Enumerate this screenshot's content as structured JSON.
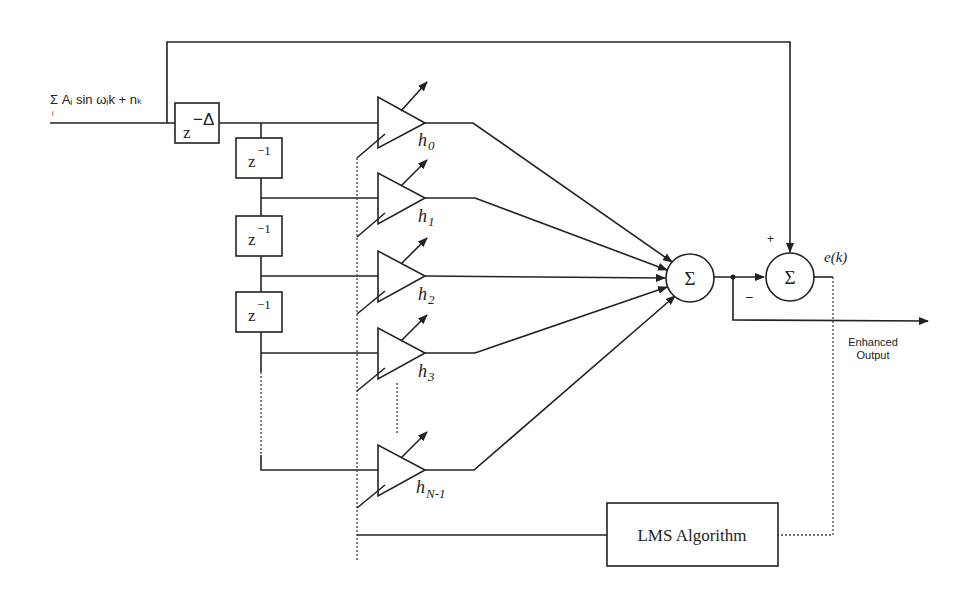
{
  "diagram": {
    "input_label": "Σ Aᵢ sin ωᵢk + nₖ",
    "input_sum_index": "i",
    "delay_block": {
      "base": "z",
      "exp": "−Δ"
    },
    "unit_delays": [
      {
        "base": "z",
        "exp": "−1"
      },
      {
        "base": "z",
        "exp": "−1"
      },
      {
        "base": "z",
        "exp": "−1"
      }
    ],
    "taps": [
      {
        "label": "h",
        "sub": "0"
      },
      {
        "label": "h",
        "sub": "1"
      },
      {
        "label": "h",
        "sub": "2"
      },
      {
        "label": "h",
        "sub": "3"
      },
      {
        "label": "h",
        "sub": "N-1"
      }
    ],
    "summer_symbol": "Σ",
    "error_summer_symbol": "Σ",
    "plus_sign": "+",
    "minus_sign": "−",
    "error_label": "e(k)",
    "output_label_line1": "Enhanced",
    "output_label_line2": "Output",
    "lms_block_label": "LMS Algorithm"
  }
}
